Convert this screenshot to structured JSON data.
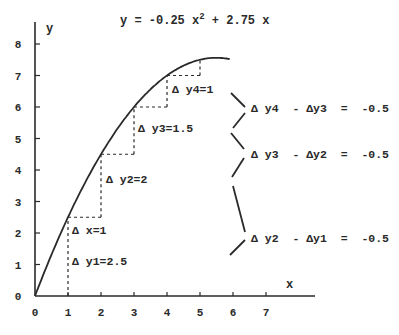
{
  "chart_data": {
    "type": "line",
    "title_parts": {
      "lhs": "y = -0.25 x",
      "exp": "2",
      "rhs": " + 2.75 x"
    },
    "xlabel": "x",
    "ylabel": "y",
    "xlim": [
      0,
      7.5
    ],
    "ylim": [
      0,
      8.5
    ],
    "x_ticks": [
      "0",
      "1",
      "2",
      "3",
      "4",
      "5",
      "6",
      "7"
    ],
    "y_ticks": [
      "0",
      "1",
      "2",
      "3",
      "4",
      "5",
      "6",
      "7",
      "8"
    ],
    "grid": false,
    "series": [
      {
        "name": "curve",
        "function": "y = -0.25*x^2 + 2.75*x",
        "x_range": [
          0,
          5.9
        ],
        "style": "solid"
      }
    ],
    "step_points": [
      {
        "x": 0,
        "y": 0
      },
      {
        "x": 1,
        "y": 2.5
      },
      {
        "x": 2,
        "y": 4.5
      },
      {
        "x": 3,
        "y": 6
      },
      {
        "x": 4,
        "y": 7
      },
      {
        "x": 5,
        "y": 7.5
      }
    ],
    "deltas": {
      "dx": 1,
      "dy": [
        2.5,
        2,
        1.5,
        1
      ],
      "second_differences": [
        -0.5,
        -0.5,
        -0.5
      ]
    }
  },
  "labels": {
    "dx1": "Δ x=1",
    "dy1": "Δ y1=2.5",
    "dy2": "Δ y2=2",
    "dy3": "Δ y3=1.5",
    "dy4": "Δ y4=1",
    "diff43": "Δ y4  - Δy3  =  -0.5",
    "diff32": "Δ y3  - Δy2  =  -0.5",
    "diff21": "Δ y2  - Δy1  =  -0.5"
  },
  "colors": {
    "ink": "#2a2a2a",
    "background": "#ffffff"
  }
}
